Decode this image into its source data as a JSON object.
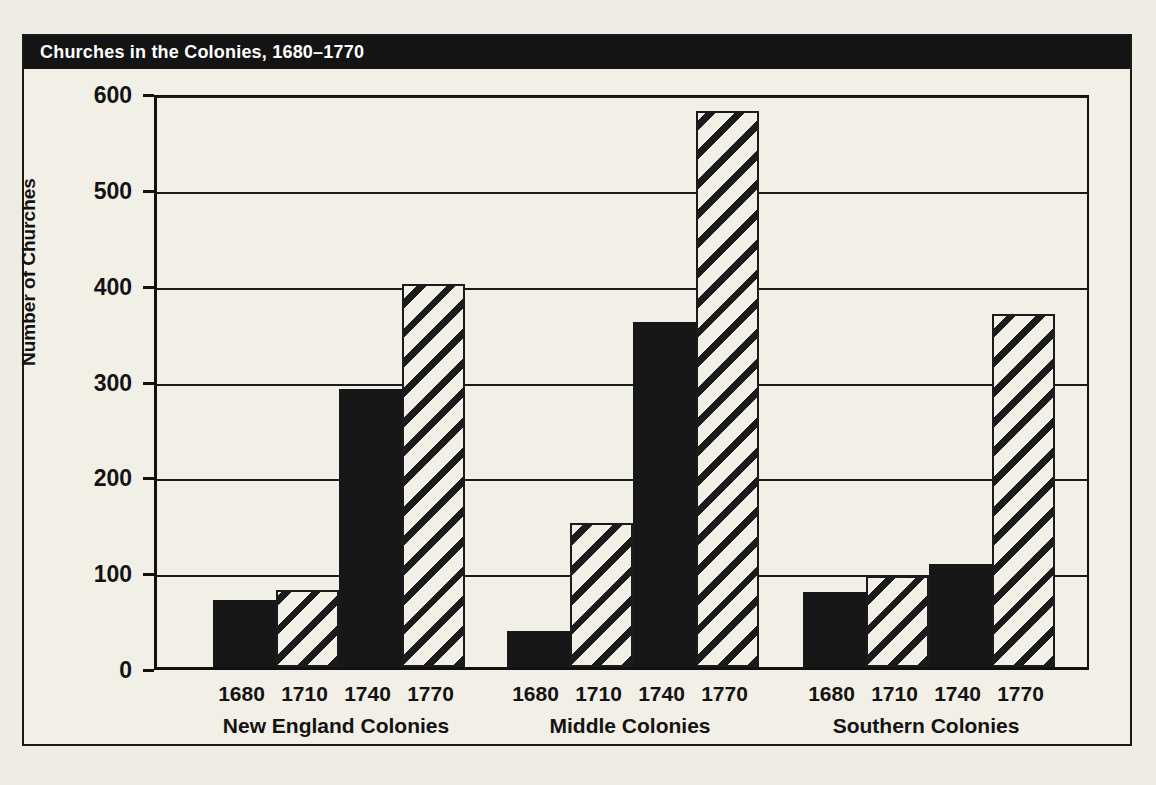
{
  "title": "Churches in the Colonies, 1680–1770",
  "colors": {
    "banner_bg": "#141414",
    "banner_text": "#ffffff",
    "paper": "#f2efe6",
    "ink": "#171717"
  },
  "chart_data": {
    "type": "bar",
    "title": "Churches in the Colonies, 1680–1770",
    "xlabel": "",
    "ylabel": "Number of Churches",
    "ylim": [
      0,
      600
    ],
    "yticks": [
      0,
      100,
      200,
      300,
      400,
      500,
      600
    ],
    "ytick_labels": [
      "0",
      "100",
      "200",
      "300",
      "400",
      "500",
      "600"
    ],
    "grid": true,
    "legend": "none",
    "categories": [
      "1680",
      "1710",
      "1740",
      "1770"
    ],
    "groups": [
      {
        "name": "New England Colonies",
        "bars": [
          {
            "year": "1680",
            "value": 70,
            "style": "solid"
          },
          {
            "year": "1710",
            "value": 80,
            "style": "hatch"
          },
          {
            "year": "1740",
            "value": 290,
            "style": "solid"
          },
          {
            "year": "1770",
            "value": 400,
            "style": "hatch"
          }
        ]
      },
      {
        "name": "Middle Colonies",
        "bars": [
          {
            "year": "1680",
            "value": 38,
            "style": "solid"
          },
          {
            "year": "1710",
            "value": 150,
            "style": "hatch"
          },
          {
            "year": "1740",
            "value": 360,
            "style": "solid"
          },
          {
            "year": "1770",
            "value": 580,
            "style": "hatch"
          }
        ]
      },
      {
        "name": "Southern Colonies",
        "bars": [
          {
            "year": "1680",
            "value": 78,
            "style": "solid"
          },
          {
            "year": "1710",
            "value": 95,
            "style": "hatch"
          },
          {
            "year": "1740",
            "value": 107,
            "style": "solid"
          },
          {
            "year": "1770",
            "value": 368,
            "style": "hatch"
          }
        ]
      }
    ]
  }
}
